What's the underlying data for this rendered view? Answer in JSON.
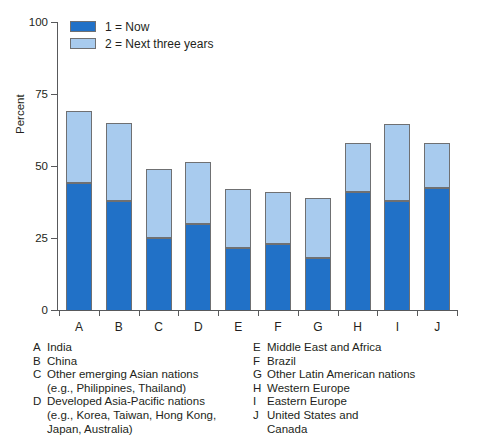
{
  "chart_data": {
    "type": "bar",
    "title": "",
    "xlabel": "",
    "ylabel": "Percent",
    "ylim": [
      0,
      100
    ],
    "yticks": [
      0,
      25,
      50,
      75,
      100
    ],
    "grid": false,
    "stacked": true,
    "legend_position": "top-left",
    "categories": [
      "A",
      "B",
      "C",
      "D",
      "E",
      "F",
      "G",
      "H",
      "I",
      "J"
    ],
    "series": [
      {
        "name": "1 = Now",
        "color": "#2171c7",
        "values": [
          44,
          38,
          25,
          30,
          21.5,
          23,
          18,
          41,
          38,
          42.5
        ]
      },
      {
        "name": "2 = Next three years",
        "color": "#a8cbee",
        "values": [
          69,
          65,
          49,
          51.5,
          42,
          41,
          39,
          58,
          64.5,
          58
        ]
      }
    ],
    "category_key": [
      {
        "letter": "A",
        "lines": [
          "India"
        ]
      },
      {
        "letter": "B",
        "lines": [
          "China"
        ]
      },
      {
        "letter": "C",
        "lines": [
          "Other emerging Asian nations",
          "(e.g., Philippines, Thailand)"
        ]
      },
      {
        "letter": "D",
        "lines": [
          "Developed Asia-Pacific nations",
          "(e.g., Korea, Taiwan, Hong Kong,",
          "Japan, Australia)"
        ]
      },
      {
        "letter": "E",
        "lines": [
          "Middle East and Africa"
        ]
      },
      {
        "letter": "F",
        "lines": [
          "Brazil"
        ]
      },
      {
        "letter": "G",
        "lines": [
          "Other Latin American nations"
        ]
      },
      {
        "letter": "H",
        "lines": [
          "Western Europe"
        ]
      },
      {
        "letter": "I",
        "lines": [
          "Eastern Europe"
        ]
      },
      {
        "letter": "J",
        "lines": [
          "United States and",
          "Canada"
        ]
      }
    ]
  },
  "legend": {
    "items": [
      {
        "label": "1 = Now",
        "swatch": "now"
      },
      {
        "label": "2 = Next three years",
        "swatch": "next"
      }
    ]
  },
  "axis": {
    "y_title": "Percent",
    "y_tick_labels": [
      "100",
      "75",
      "50",
      "25",
      "0"
    ]
  }
}
